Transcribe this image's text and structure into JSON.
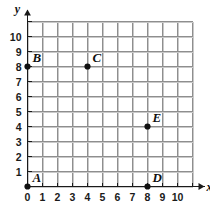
{
  "chart_data": {
    "type": "scatter",
    "title": "",
    "xlabel": "x",
    "ylabel": "y",
    "xlim": [
      0,
      10
    ],
    "ylim": [
      0,
      10
    ],
    "grid": true,
    "legend": "none",
    "x_ticks": [
      "0",
      "1",
      "2",
      "3",
      "4",
      "5",
      "6",
      "7",
      "8",
      "9",
      "10"
    ],
    "y_ticks": [
      "1",
      "2",
      "3",
      "4",
      "5",
      "6",
      "7",
      "8",
      "9",
      "10"
    ],
    "points": [
      {
        "label": "A",
        "x": 0,
        "y": 0
      },
      {
        "label": "B",
        "x": 0,
        "y": 8
      },
      {
        "label": "C",
        "x": 4,
        "y": 8
      },
      {
        "label": "D",
        "x": 8,
        "y": 0
      },
      {
        "label": "E",
        "x": 8,
        "y": 4
      }
    ],
    "colors": {
      "point": "#111111",
      "grid": "#8e8e8e",
      "axis": "#1a1a1a",
      "background": "#ffffff"
    }
  },
  "axes": {
    "x_name": "x",
    "y_name": "y"
  }
}
